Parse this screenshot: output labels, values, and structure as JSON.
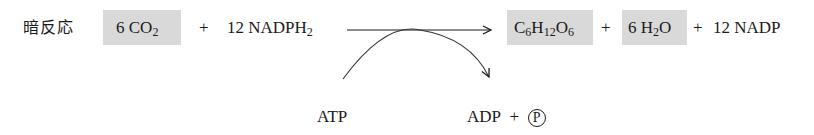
{
  "diagram": {
    "title_label": "暗反応",
    "reactants": [
      {
        "coef": "6",
        "formula_parts": [
          "CO",
          "2"
        ],
        "highlighted": true
      },
      {
        "coef": "12",
        "formula_parts": [
          "NADPH",
          "2"
        ],
        "highlighted": false
      }
    ],
    "products": [
      {
        "formula_parts": [
          "C",
          "6",
          "H",
          "12",
          "O",
          "6"
        ],
        "highlighted": true
      },
      {
        "coef": "6",
        "formula_parts": [
          "H",
          "2",
          "O"
        ],
        "highlighted": true
      },
      {
        "coef": "12",
        "formula": "NADP",
        "highlighted": false
      }
    ],
    "plus": "+",
    "coupled": {
      "input": "ATP",
      "output_main": "ADP",
      "output_plus": "+",
      "output_phosphate": "P"
    },
    "colors": {
      "highlight_box": "#d9d9d9",
      "ink": "#1a1a1a"
    }
  }
}
